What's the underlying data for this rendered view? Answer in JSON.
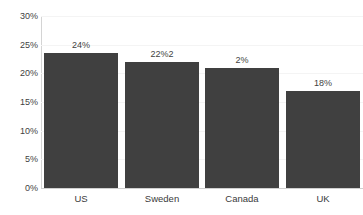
{
  "chart_data": {
    "type": "bar",
    "title": "",
    "xlabel": "",
    "ylabel": "",
    "categories": [
      "US",
      "Sweden",
      "Canada",
      "UK"
    ],
    "values": [
      23.5,
      22.0,
      21.0,
      17.0
    ],
    "data_labels": [
      "24%",
      "22%2",
      "2%",
      "18%"
    ],
    "ylim": [
      0,
      30
    ],
    "ytick_labels": [
      "30%",
      "25%",
      "20%",
      "15%",
      "10%",
      "5%",
      "0%"
    ],
    "ytick_values": [
      30,
      25,
      20,
      15,
      10,
      5,
      0
    ],
    "grid": true,
    "legend": false,
    "bar_color": "#404040",
    "text_color": "#3a3a3a",
    "gridline_color": "#f4f4f4",
    "axis_color": "#d4d4d4",
    "background_color": "#ffffff"
  },
  "title_strip": {
    "text": ""
  }
}
